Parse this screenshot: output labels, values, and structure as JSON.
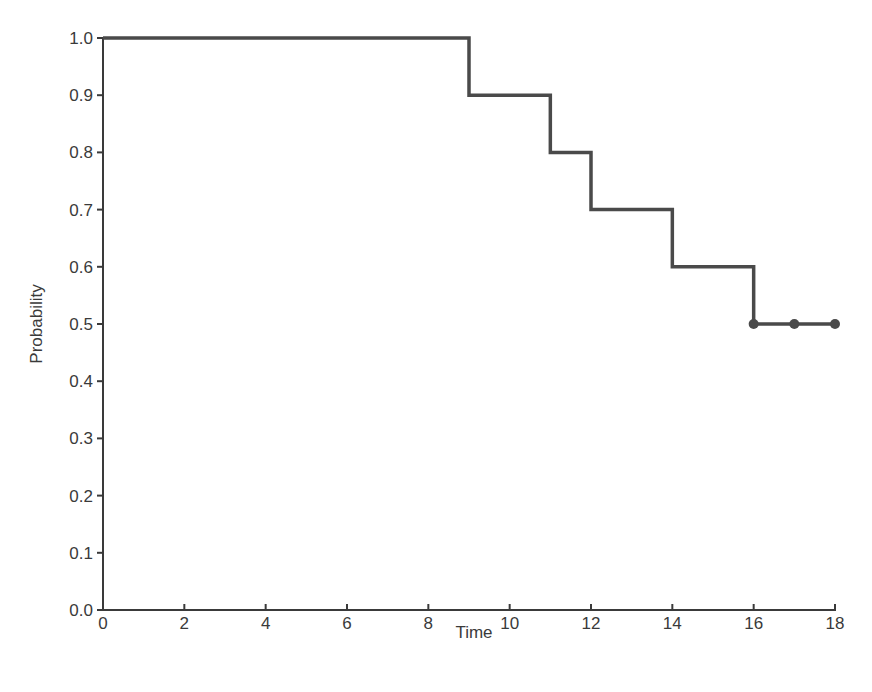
{
  "chart_data": {
    "type": "line",
    "subtype": "step",
    "title": "",
    "xlabel": "Time",
    "ylabel": "Probability",
    "xlim": [
      0,
      18
    ],
    "ylim": [
      0.0,
      1.0
    ],
    "x_ticks": [
      "0",
      "2",
      "4",
      "6",
      "8",
      "10",
      "12",
      "14",
      "16",
      "18"
    ],
    "y_ticks": [
      "0.0",
      "0.1",
      "0.2",
      "0.3",
      "0.4",
      "0.5",
      "0.6",
      "0.7",
      "0.8",
      "0.9",
      "1.0"
    ],
    "grid": false,
    "legend": null,
    "series": [
      {
        "name": "Survival probability",
        "step_points": [
          {
            "x": 0,
            "y": 1.0
          },
          {
            "x": 9,
            "y": 0.9
          },
          {
            "x": 11,
            "y": 0.8
          },
          {
            "x": 12,
            "y": 0.7
          },
          {
            "x": 14,
            "y": 0.6
          },
          {
            "x": 16,
            "y": 0.5
          },
          {
            "x": 18,
            "y": 0.5
          }
        ],
        "censored_markers": [
          {
            "x": 16,
            "y": 0.5
          },
          {
            "x": 17,
            "y": 0.5
          },
          {
            "x": 18,
            "y": 0.5
          }
        ],
        "color": "#4a4a4a"
      }
    ]
  },
  "colors": {
    "line": "#4a4a4a",
    "axis": "#3a3a3a",
    "background": "#ffffff"
  }
}
